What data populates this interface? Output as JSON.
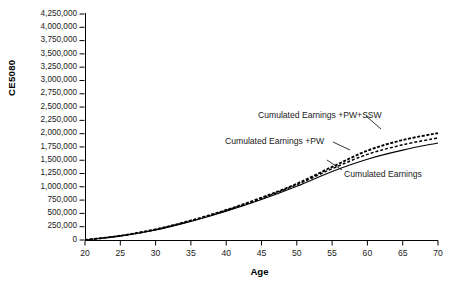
{
  "chart_data": {
    "type": "line",
    "title": "",
    "xlabel": "Age",
    "ylabel": "CE5080",
    "xlim": [
      20,
      70
    ],
    "ylim": [
      0,
      4250000
    ],
    "grid": false,
    "legend_position": "inline-annotations",
    "x": [
      20,
      25,
      30,
      35,
      40,
      45,
      50,
      55,
      60,
      65,
      70
    ],
    "xticks": [
      "20",
      "25",
      "30",
      "35",
      "40",
      "45",
      "50",
      "55",
      "60",
      "65",
      "70"
    ],
    "yticks": [
      "4,250,000",
      "4,000,000",
      "3,750,000",
      "3,500,000",
      "3,250,000",
      "3,000,000",
      "2,750,000",
      "2,500,000",
      "2,250,000",
      "2,000,000",
      "1,750,000",
      "1,500,000",
      "1,250,000",
      "1,000,000",
      "750,000",
      "500,000",
      "250,000",
      "0"
    ],
    "series": [
      {
        "name": "Cumulated Earnings",
        "style": "solid",
        "values": [
          0,
          75000,
          190000,
          350000,
          540000,
          760000,
          1010000,
          1290000,
          1520000,
          1690000,
          1825000
        ]
      },
      {
        "name": "Cumulated Earnings +PW",
        "style": "dashed",
        "values": [
          0,
          78000,
          196000,
          360000,
          555000,
          782000,
          1040000,
          1340000,
          1610000,
          1790000,
          1920000
        ]
      },
      {
        "name": "Cumulated Earnings +PW+SSW",
        "style": "dashed",
        "values": [
          0,
          80000,
          200000,
          366000,
          564000,
          795000,
          1058000,
          1375000,
          1680000,
          1880000,
          2010000
        ]
      }
    ],
    "annotations": [
      {
        "text": "Cumulated Earnings +PW+SSW",
        "x_px": 258,
        "y_px": 111
      },
      {
        "text": "Cumulated Earnings +PW",
        "x_px": 225,
        "y_px": 137
      },
      {
        "text": "Cumulated Earnings",
        "x_px": 344,
        "y_px": 170
      }
    ]
  }
}
